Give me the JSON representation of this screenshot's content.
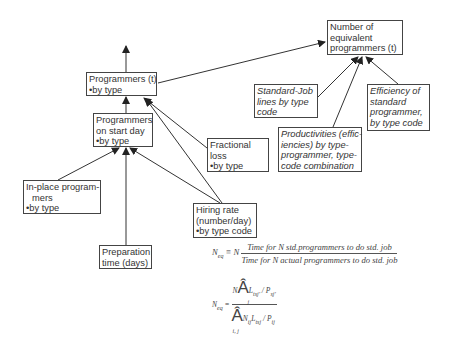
{
  "diagram": {
    "nodes": {
      "equiv": {
        "lines": [
          "Number of",
          "equivalent",
          "programmers (t)"
        ]
      },
      "prog_t": {
        "lines": [
          "Programmers (t)"
        ],
        "bullet": "by type"
      },
      "start_day": {
        "lines": [
          "Programmers",
          "on start day"
        ],
        "bullet": "by type"
      },
      "frac_loss": {
        "lines": [
          "Fractional",
          "loss"
        ],
        "bullet": "by type"
      },
      "std_job": {
        "lines": [
          "Standard-Job",
          "lines by type",
          "code"
        ]
      },
      "productivities": {
        "lines": [
          "Productivities (effic-",
          "iencies) by type-",
          "programmer, type-",
          "code combination"
        ]
      },
      "efficiency": {
        "lines": [
          "Efficiency of",
          "standard",
          "programmer,",
          "by type code"
        ]
      },
      "in_place": {
        "lines": [
          "In-place program-",
          "mers"
        ],
        "bullet": "by type"
      },
      "hiring": {
        "lines": [
          "Hiring rate",
          "(number/day)"
        ],
        "bullet": "by type code"
      },
      "prep": {
        "lines": [
          "Preparation",
          "time (days)"
        ]
      }
    },
    "edges": [
      {
        "from": "prog_t",
        "to": "output-up"
      },
      {
        "from": "start_day",
        "to": "prog_t"
      },
      {
        "from": "frac_loss",
        "to": "prog_t"
      },
      {
        "from": "hiring",
        "to": "prog_t"
      },
      {
        "from": "hiring",
        "to": "start_day"
      },
      {
        "from": "in_place",
        "to": "start_day"
      },
      {
        "from": "prep",
        "to": "start_day"
      },
      {
        "from": "prog_t",
        "to": "equiv"
      },
      {
        "from": "std_job",
        "to": "equiv"
      },
      {
        "from": "productivities",
        "to": "equiv"
      },
      {
        "from": "efficiency",
        "to": "equiv"
      }
    ]
  },
  "formulas": {
    "f1": {
      "lhs": "N",
      "lhs_sub": "eq",
      "op": "≡ N",
      "numerator": "Time for N std.programmers to do std. job",
      "denominator": "Time for N actual programmers to do std. job"
    },
    "f2": {
      "lhs": "N",
      "lhs_sub": "eq",
      "op": "=",
      "num_prefix": "N",
      "num_sigma": "Â",
      "num_sigma_sub": "j",
      "num_term": "L",
      "num_term_sub": "tsj'",
      "num_div": "/ P",
      "num_div_sub": "sj'",
      "den_sigma": "Â",
      "den_sigma_sub": "i, j",
      "den_term": "N",
      "den_term_sub": "ij",
      "den_term2": "L",
      "den_term2_sub": "tsj",
      "den_div": "/ P",
      "den_div_sub": "ij"
    }
  }
}
